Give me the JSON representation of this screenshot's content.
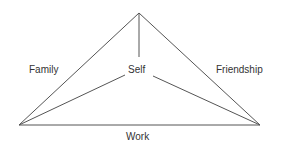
{
  "diagram": {
    "type": "triangle-relationship",
    "nodes": {
      "apex": {
        "x": 139,
        "y": 13
      },
      "left": {
        "x": 19,
        "y": 125
      },
      "right": {
        "x": 260,
        "y": 125
      },
      "center_top": {
        "x": 139,
        "y": 57
      },
      "center_left": {
        "x": 125,
        "y": 75
      },
      "center_right": {
        "x": 153,
        "y": 76
      }
    },
    "labels": {
      "family": "Family",
      "self": "Self",
      "friendship": "Friendship",
      "work": "Work"
    },
    "colors": {
      "line": "#555555",
      "text": "#333333"
    }
  }
}
